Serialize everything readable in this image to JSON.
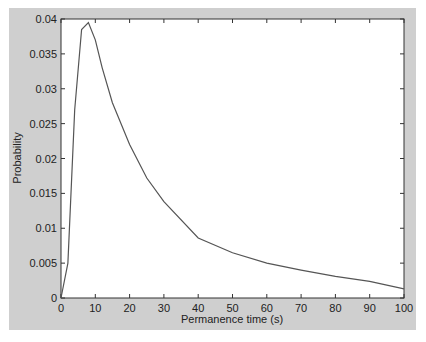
{
  "chart_data": {
    "type": "line",
    "title": "",
    "xlabel": "Permanence time (s)",
    "ylabel": "Probability",
    "xlim": [
      0,
      100
    ],
    "ylim": [
      0,
      0.04
    ],
    "grid": false,
    "legend": null,
    "x_ticks": [
      "0",
      "10",
      "20",
      "30",
      "40",
      "50",
      "60",
      "70",
      "80",
      "90",
      "100"
    ],
    "y_ticks": [
      "0",
      "0.005",
      "0.01",
      "0.015",
      "0.02",
      "0.025",
      "0.03",
      "0.035",
      "0.04"
    ],
    "series": [
      {
        "name": "Probability",
        "x": [
          0,
          2,
          4,
          6,
          8,
          10,
          12,
          15,
          20,
          25,
          30,
          40,
          50,
          60,
          70,
          80,
          90,
          100
        ],
        "values": [
          0,
          0.005,
          0.027,
          0.0385,
          0.0395,
          0.037,
          0.033,
          0.028,
          0.022,
          0.0172,
          0.0138,
          0.0086,
          0.0065,
          0.005,
          0.004,
          0.0031,
          0.0024,
          0.0013
        ]
      }
    ],
    "colors": {
      "line": "#555555",
      "background": "#cfcfcf",
      "plot_area": "#ffffff",
      "axis": "#333333"
    }
  }
}
